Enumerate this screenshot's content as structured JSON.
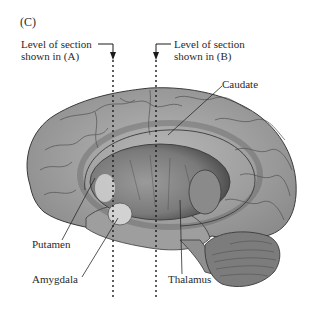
{
  "figure": {
    "panel_label": "(C)",
    "section_a": {
      "line1": "Level of section",
      "line2": "shown in (A)"
    },
    "section_b": {
      "line1": "Level of section",
      "line2": "shown in (B)"
    },
    "labels": {
      "caudate": "Caudate",
      "putamen": "Putamen",
      "amygdala": "Amygdala",
      "thalamus": "Thalamus"
    },
    "colors": {
      "brain_fill": "#a9a9a9",
      "brain_dark": "#6e6e6e",
      "outline": "#3a3a3a",
      "highlight": "#d8d8d8"
    }
  }
}
